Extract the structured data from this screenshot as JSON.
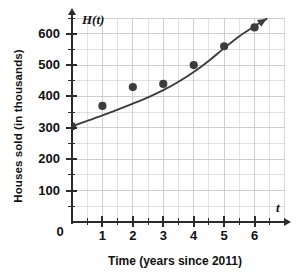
{
  "chart_data": {
    "type": "scatter",
    "title": "",
    "xlabel": "Time (years since 2011)",
    "ylabel": "Houses sold (in thousands)",
    "x_var_label": "t",
    "y_var_label": "H(t)",
    "xlim": [
      0,
      7
    ],
    "ylim": [
      0,
      650
    ],
    "x_ticks": [
      0,
      1,
      2,
      3,
      4,
      5,
      6
    ],
    "x_tick_labels": [
      "0",
      "1",
      "2",
      "3",
      "4",
      "5",
      "6"
    ],
    "x_minor_step": 0.5,
    "y_ticks": [
      0,
      100,
      200,
      300,
      400,
      500,
      600
    ],
    "y_tick_labels": [
      "0",
      "100",
      "200",
      "300",
      "400",
      "500",
      "600"
    ],
    "y_minor_step": 50,
    "grid": true,
    "grid_color": "#c9c9d6",
    "legend": "none",
    "series": [
      {
        "name": "Houses sold",
        "type": "scatter",
        "marker": "filled-circle",
        "color": "#3c3c3c",
        "x": [
          0,
          1,
          2,
          3,
          4,
          5,
          6
        ],
        "values": [
          305,
          370,
          430,
          440,
          500,
          560,
          620
        ]
      },
      {
        "name": "Fitted curve",
        "type": "line",
        "color": "#3c3c3c",
        "arrow_end": true,
        "x": [
          0,
          0.5,
          1,
          1.5,
          2,
          2.5,
          3,
          3.5,
          4,
          4.5,
          5,
          5.5,
          6,
          6.4
        ],
        "values": [
          305,
          322,
          340,
          358,
          377,
          397,
          420,
          447,
          478,
          514,
          554,
          592,
          624,
          648
        ]
      }
    ],
    "annotations": []
  },
  "axis": {
    "y_title": "Houses sold (in thousands)",
    "x_title": "Time (years since 2011)",
    "y_var": "H(t)",
    "x_var": "t",
    "origin": "0"
  },
  "colors": {
    "marker": "#3c3c3c",
    "curve": "#3c3c3c",
    "axis": "#2b2b2b",
    "grid": "#c9c9d6",
    "background": "#ffffff",
    "text": "#111111"
  }
}
